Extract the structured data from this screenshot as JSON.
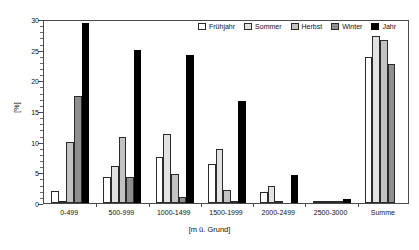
{
  "chart_data": {
    "type": "bar",
    "title": "",
    "xlabel": "[m ü. Grund]",
    "ylabel": "[%]",
    "ylim": [
      0,
      30
    ],
    "ytick_labels": [
      "0",
      "5",
      "10",
      "15",
      "20",
      "25",
      "30"
    ],
    "ytick_values": [
      0,
      5,
      10,
      15,
      20,
      25,
      30
    ],
    "y_minor_step": 1,
    "grid": false,
    "legend_position": "top-right",
    "categories": [
      "0-499",
      "500-999",
      "1000-1499",
      "1500-1999",
      "2000-2499",
      "2500-3000",
      "Summe"
    ],
    "series": [
      {
        "name": "Frühjahr",
        "color": "#ffffff",
        "values": [
          2.0,
          4.3,
          7.5,
          6.4,
          1.8,
          0.1,
          23.8
        ]
      },
      {
        "name": "Sommer",
        "color": "#e2e2e2",
        "values": [
          0.2,
          6.0,
          11.2,
          8.8,
          2.7,
          0.3,
          27.2
        ]
      },
      {
        "name": "Herbst",
        "color": "#c2c2c2",
        "values": [
          10.0,
          10.7,
          4.7,
          2.1,
          0.2,
          0.1,
          26.5
        ]
      },
      {
        "name": "Winter",
        "color": "#8f8f8f",
        "values": [
          17.4,
          4.2,
          0.9,
          0.2,
          0.0,
          0.1,
          22.6
        ]
      },
      {
        "name": "Jahr",
        "color": "#000000",
        "values": [
          29.4,
          25.0,
          24.1,
          16.7,
          4.5,
          0.6,
          0.0
        ]
      }
    ]
  }
}
